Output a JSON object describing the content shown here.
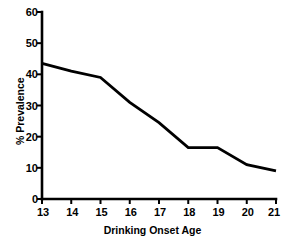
{
  "chart_data": {
    "type": "line",
    "title": "",
    "subtitle": "",
    "xlabel": "Drinking Onset Age",
    "ylabel": "% Prevalence",
    "x": [
      13,
      14,
      15,
      16,
      17,
      18,
      19,
      20,
      21
    ],
    "values": [
      43.5,
      41.0,
      39.0,
      31.0,
      24.5,
      16.5,
      16.5,
      11.0,
      9.0
    ],
    "series": [
      {
        "name": "Prevalence",
        "values": [
          43.5,
          41.0,
          39.0,
          31.0,
          24.5,
          16.5,
          16.5,
          11.0,
          9.0
        ]
      }
    ],
    "xlim": [
      13,
      21
    ],
    "ylim": [
      0,
      60
    ],
    "x_ticks": [
      "13",
      "14",
      "15",
      "16",
      "17",
      "18",
      "19",
      "20",
      "21"
    ],
    "y_ticks": [
      "0",
      "10",
      "20",
      "30",
      "40",
      "50",
      "60"
    ],
    "grid": false,
    "legend": false,
    "legend_position": "none",
    "line_color": "#000000",
    "background_color": "#ffffff",
    "axis_color": "#000000"
  },
  "axes": {
    "y_title": "% Prevalence",
    "x_title": "Drinking Onset Age"
  }
}
